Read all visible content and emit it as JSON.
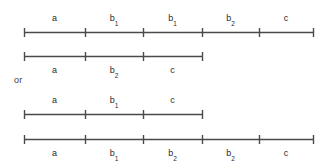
{
  "figure": {
    "connector_text": "or",
    "line_color": "#4a4a4a",
    "text_color": "#2b2b2b",
    "background_color": "#ffffff",
    "axis_label_unit": "",
    "rows": [
      {
        "id": "row-1",
        "label_position": "above",
        "y": 32,
        "x_start": 24,
        "x_end": 313,
        "ticks": [
          24,
          85,
          143,
          202,
          259,
          313
        ],
        "segments": [
          {
            "base": "a",
            "sub": "",
            "center": 54.5
          },
          {
            "base": "b",
            "sub": "1",
            "center": 114
          },
          {
            "base": "b",
            "sub": "1",
            "center": 172.5
          },
          {
            "base": "b",
            "sub": "2",
            "center": 230.5
          },
          {
            "base": "c",
            "sub": "",
            "center": 286
          }
        ]
      },
      {
        "id": "row-2",
        "label_position": "below",
        "y": 56,
        "x_start": 24,
        "x_end": 202,
        "ticks": [
          24,
          85,
          143,
          202
        ],
        "segments": [
          {
            "base": "a",
            "sub": "",
            "center": 54.5
          },
          {
            "base": "b",
            "sub": "2",
            "center": 114
          },
          {
            "base": "c",
            "sub": "",
            "center": 172.5
          }
        ]
      },
      {
        "id": "row-3",
        "label_position": "above",
        "y": 114,
        "x_start": 24,
        "x_end": 202,
        "ticks": [
          24,
          85,
          143,
          202
        ],
        "segments": [
          {
            "base": "a",
            "sub": "",
            "center": 54.5
          },
          {
            "base": "b",
            "sub": "1",
            "center": 114
          },
          {
            "base": "c",
            "sub": "",
            "center": 172.5
          }
        ]
      },
      {
        "id": "row-4",
        "label_position": "below",
        "y": 139,
        "x_start": 24,
        "x_end": 313,
        "ticks": [
          24,
          85,
          143,
          202,
          259,
          313
        ],
        "segments": [
          {
            "base": "a",
            "sub": "",
            "center": 54.5
          },
          {
            "base": "b",
            "sub": "1",
            "center": 114
          },
          {
            "base": "b",
            "sub": "2",
            "center": 172.5
          },
          {
            "base": "b",
            "sub": "2",
            "center": 230.5
          },
          {
            "base": "c",
            "sub": "",
            "center": 286
          }
        ]
      }
    ],
    "connector": {
      "x": 14,
      "y": 75
    }
  }
}
